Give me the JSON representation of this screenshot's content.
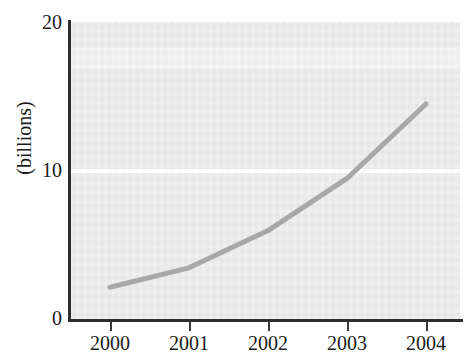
{
  "page": {
    "title_fragment": "",
    "caption_fragment": ""
  },
  "chart_data": {
    "type": "line",
    "title": "",
    "xlabel": "",
    "ylabel": "(billions)",
    "categories": [
      "2000",
      "2001",
      "2002",
      "2003",
      "2004"
    ],
    "x": [
      2000,
      2001,
      2002,
      2003,
      2004
    ],
    "values": [
      2.2,
      3.5,
      6.0,
      9.5,
      14.5
    ],
    "series": [
      {
        "name": "(billions)",
        "values": [
          2.2,
          3.5,
          6.0,
          9.5,
          14.5
        ],
        "color": "#a8a8a8"
      }
    ],
    "ylim": [
      0,
      20
    ],
    "y_ticks": [
      0,
      10,
      20
    ],
    "y_tick_labels": [
      "0",
      "10",
      "20"
    ],
    "x_tick_labels": [
      "2000",
      "2001",
      "2002",
      "2003",
      "2004"
    ],
    "grid": true,
    "gridlines_y": [
      10
    ],
    "gridline_color": "#fdfdfd",
    "legend": false,
    "legend_position": "none",
    "plot_background": "#ebebeb",
    "axis_color": "#2e2e2e",
    "line_width_px": 5
  },
  "axis": {
    "y_labels": [
      "20",
      "10",
      "0"
    ],
    "y_title": "(billions)",
    "x_labels": [
      "2000",
      "2001",
      "2002",
      "2003",
      "2004"
    ]
  }
}
